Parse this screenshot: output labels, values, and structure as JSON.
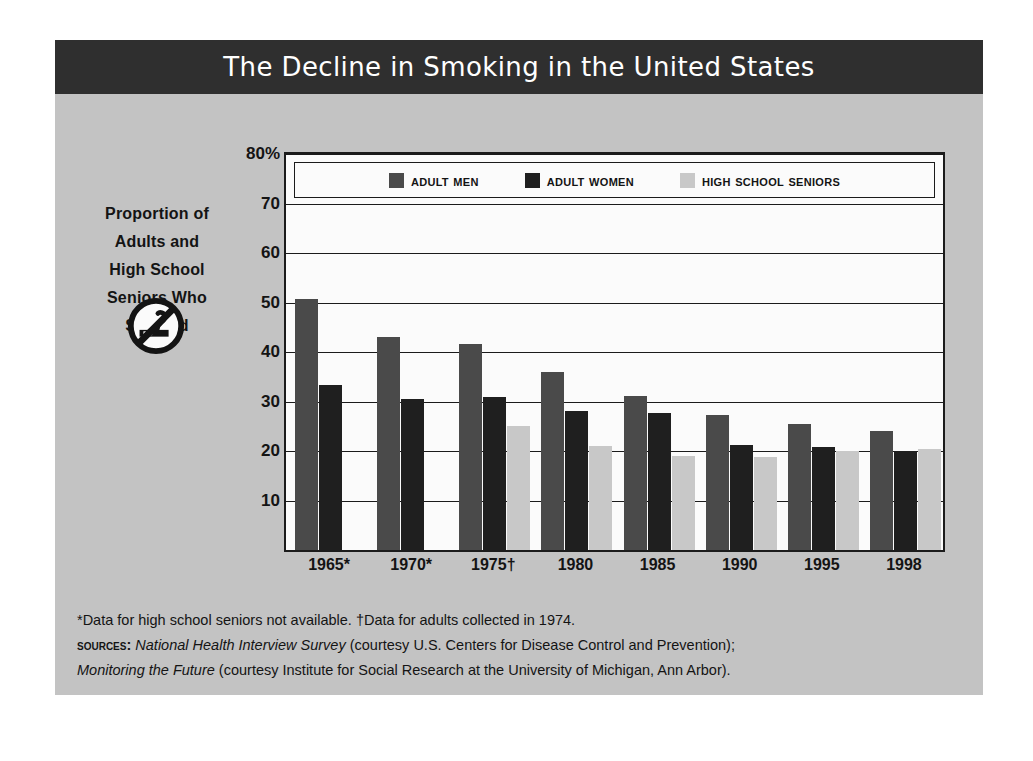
{
  "title": "The Decline in Smoking in the United States",
  "axis_caption": {
    "lines": [
      "Proportion of",
      "Adults and",
      "High School",
      "Seniors Who",
      "Smoked"
    ],
    "icon": "no-smoking-icon"
  },
  "footnotes": {
    "line1": "*Data for high school seniors not available.  †Data for adults collected in 1974.",
    "line2_label": "Sources:",
    "line2_italic": "National Health Interview Survey",
    "line2_rest": "(courtesy U.S. Centers for Disease Control and Prevention);",
    "line3_italic": "Monitoring the Future",
    "line3_rest": "(courtesy Institute for Social Research at the University of Michigan, Ann Arbor)."
  },
  "colors": {
    "adult_men": "#4a4a4a",
    "adult_women": "#1f1f1f",
    "high_school_seniors": "#c8c8c8",
    "title_bar": "#2f2f2f",
    "panel_background": "#c3c3c3",
    "plot_background": "#fbfbfb",
    "axis": "#1b1b1b"
  },
  "chart_data": {
    "type": "bar",
    "title": "The Decline in Smoking in the United States",
    "xlabel": "",
    "ylabel": "Proportion of Adults and High School Seniors Who Smoked",
    "ylim": [
      0,
      80
    ],
    "yticks": [
      10,
      20,
      30,
      40,
      50,
      60,
      70,
      80
    ],
    "ytick_labels": [
      "10",
      "20",
      "30",
      "40",
      "50",
      "60",
      "70",
      "80%"
    ],
    "grid": true,
    "legend_position": "top-inside",
    "categories": [
      "1965*",
      "1970*",
      "1975†",
      "1980",
      "1985",
      "1990",
      "1995",
      "1998"
    ],
    "series": [
      {
        "name": "Adult Men",
        "color": "#4a4a4a",
        "values": [
          50.8,
          43.1,
          41.6,
          35.9,
          31.2,
          27.2,
          25.5,
          24.0
        ]
      },
      {
        "name": "Adult Women",
        "color": "#1f1f1f",
        "values": [
          33.3,
          30.6,
          31.0,
          28.1,
          27.6,
          21.2,
          20.8,
          20.0
        ]
      },
      {
        "name": "High School Seniors",
        "color": "#c8c8c8",
        "values": [
          null,
          null,
          25.0,
          21.1,
          18.9,
          18.8,
          20.1,
          20.4
        ]
      }
    ],
    "annotations": [
      "*Data for high school seniors not available.",
      "†Data for adults collected in 1974."
    ]
  }
}
